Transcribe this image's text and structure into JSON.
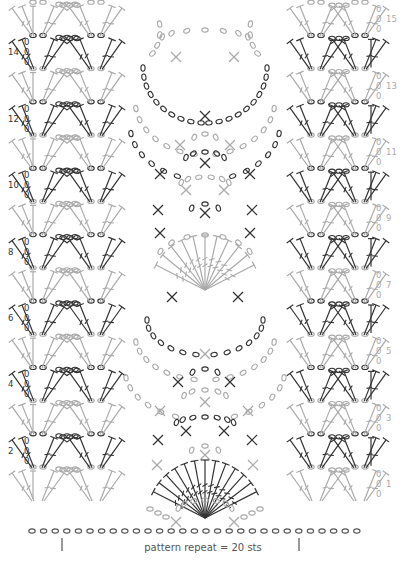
{
  "caption": "pattern repeat = 20 sts",
  "colors": {
    "even_rows": "#333333",
    "odd_rows": "#aaaaaa",
    "foundation": "#555555",
    "caption": "#555555",
    "background": "#ffffff"
  },
  "rows": {
    "count": 15,
    "left_labels": [
      "14",
      "12",
      "10",
      "8",
      "6",
      "4",
      "2"
    ],
    "right_labels": [
      "15",
      "13",
      "11",
      "9",
      "7",
      "5",
      "3",
      "1"
    ],
    "turning_chain_marks": [
      "0",
      "0",
      "0"
    ]
  },
  "symbols": {
    "chain": "oval",
    "single_crochet": "cross",
    "double_crochet": "T-with-bar",
    "treble_crochet": "T-with-double-bar"
  },
  "repeat_markers": {
    "left_x": 62,
    "right_x": 299,
    "stitches": 20
  }
}
